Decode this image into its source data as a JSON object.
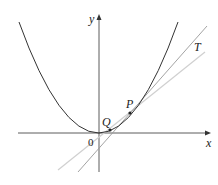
{
  "diagram": {
    "axes": {
      "x_label": "x",
      "y_label": "y",
      "origin_label": "0"
    },
    "points": [
      {
        "label": "P"
      },
      {
        "label": "Q"
      }
    ],
    "lines": [
      {
        "label": "T",
        "role": "tangent"
      },
      {
        "label": "",
        "role": "secant"
      }
    ],
    "curve": "parabola",
    "colors": {
      "curve": "#333333",
      "axes": "#333333",
      "tangent": "#999999",
      "secant": "#cccccc"
    }
  }
}
